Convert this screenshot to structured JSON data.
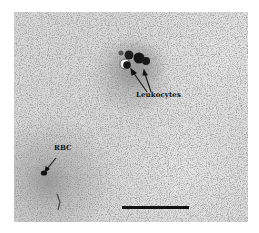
{
  "figure": {
    "type": "micrograph",
    "background_color": "#d9d9d9",
    "annotations": [
      {
        "id": "leukocytes",
        "label": "Leukocytes",
        "arrow_count": 2
      },
      {
        "id": "rbc",
        "label": "RBC",
        "arrow_count": 1
      }
    ],
    "scale_bar": {
      "present": true,
      "color": "#111111",
      "label": ""
    }
  }
}
